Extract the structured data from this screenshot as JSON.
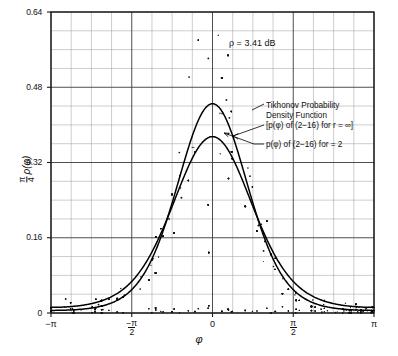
{
  "chart_data": {
    "type": "scatter",
    "title": "",
    "xlabel": "φ",
    "ylabel": "π/4 ρ(φ)",
    "xlim": [
      -3.14159265,
      3.14159265
    ],
    "ylim": [
      0,
      0.64
    ],
    "grid": true,
    "legend_position": "inline-annotation",
    "x_tick_labels": [
      "-π",
      "-π/2",
      "0",
      "π/2",
      "π"
    ],
    "x_tick_values": [
      -3.14159265,
      -1.57079633,
      0,
      1.57079633,
      3.14159265
    ],
    "y_tick_labels": [
      "0",
      "0.16",
      "0.32",
      "0.48",
      "0.64"
    ],
    "y_tick_values": [
      0,
      0.16,
      0.32,
      0.48,
      0.64
    ],
    "x_minor_divisions": 4,
    "y_minor_divisions": 4,
    "annotations": [
      {
        "name": "rho-value",
        "text": "ρ = 3.41 dB"
      },
      {
        "name": "tikhonov-label-line1",
        "text": "Tikhonov Probability"
      },
      {
        "name": "tikhonov-label-line2",
        "text": "Density Function"
      },
      {
        "name": "tikhonov-label-line3",
        "text": "[p(φ) of (2−16) for r = ∞]"
      },
      {
        "name": "curve-r2-label",
        "text": "p(φ) of (2−16) for = 2"
      }
    ],
    "series": [
      {
        "name": "Tikhonov Probability Density Function [p(φ) of (2-16) for r = ∞]",
        "type": "line",
        "peak_x": 0,
        "peak_y": 0.445,
        "kappa": 2.193,
        "x": [
          -3.14159,
          -2.96706,
          -2.79253,
          -2.61799,
          -2.44346,
          -2.26893,
          -2.0944,
          -1.91986,
          -1.74533,
          -1.5708,
          -1.39626,
          -1.22173,
          -1.0472,
          -0.87266,
          -0.69813,
          -0.5236,
          -0.34907,
          -0.17453,
          0,
          0.17453,
          0.34907,
          0.5236,
          0.69813,
          0.87266,
          1.0472,
          1.22173,
          1.39626,
          1.5708,
          1.74533,
          1.91986,
          2.0944,
          2.26893,
          2.44346,
          2.61799,
          2.79253,
          2.96706,
          3.14159
        ],
        "y": [
          0.0062,
          0.0065,
          0.0076,
          0.0094,
          0.0122,
          0.0163,
          0.0221,
          0.0301,
          0.0409,
          0.0551,
          0.0735,
          0.0966,
          0.1248,
          0.1583,
          0.1966,
          0.2387,
          0.2826,
          0.3257,
          0.3644,
          0.3257,
          0.2826,
          0.2387,
          0.1966,
          0.1583,
          0.1248,
          0.0966,
          0.0735,
          0.0551,
          0.0409,
          0.0301,
          0.0221,
          0.0163,
          0.0122,
          0.0094,
          0.0076,
          0.0065,
          0.0062
        ]
      },
      {
        "name": "p(φ) of (2-16) for = 2",
        "type": "line",
        "peak_x": 0,
        "peak_y": 0.375,
        "kappa": 1.72,
        "x": [
          -3.14159,
          -2.96706,
          -2.79253,
          -2.61799,
          -2.44346,
          -2.26893,
          -2.0944,
          -1.91986,
          -1.74533,
          -1.5708,
          -1.39626,
          -1.22173,
          -1.0472,
          -0.87266,
          -0.69813,
          -0.5236,
          -0.34907,
          -0.17453,
          0,
          0.17453,
          0.34907,
          0.5236,
          0.69813,
          0.87266,
          1.0472,
          1.22173,
          1.39626,
          1.5708,
          1.74533,
          1.91986,
          2.0944,
          2.26893,
          2.44346,
          2.61799,
          2.79253,
          2.96706,
          3.14159
        ],
        "y": [
          0.0102,
          0.0107,
          0.0121,
          0.0146,
          0.0183,
          0.0235,
          0.0306,
          0.0399,
          0.0519,
          0.0671,
          0.0861,
          0.1093,
          0.1369,
          0.1689,
          0.2048,
          0.2436,
          0.2834,
          0.3219,
          0.3561,
          0.3219,
          0.2834,
          0.2436,
          0.2048,
          0.1689,
          0.1369,
          0.1093,
          0.0861,
          0.0671,
          0.0519,
          0.0399,
          0.0306,
          0.0235,
          0.0183,
          0.0146,
          0.0121,
          0.0107,
          0.0102
        ]
      },
      {
        "name": "experimental-scatter",
        "type": "scatter",
        "point_count": 470,
        "description": "Measured phase-error density samples scattered about the theoretical curves, with largest vertical spread near φ = 0 reaching about 0.56"
      }
    ]
  }
}
